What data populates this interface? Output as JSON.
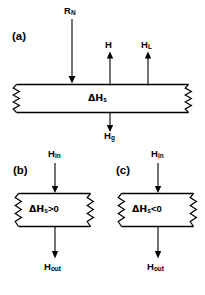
{
  "figure": {
    "type": "energy-balance-box-diagram",
    "background_color": "#ffffff",
    "line_color": "#000000",
    "panels": [
      {
        "id": "a",
        "tag": "(a)",
        "box_label": "ΔH",
        "box_label_sub": "s",
        "fluxes": [
          {
            "name": "R_N",
            "label": "R",
            "sub": "N",
            "direction": "down",
            "side": "top"
          },
          {
            "name": "H",
            "label": "H",
            "sub": "",
            "direction": "up",
            "side": "top"
          },
          {
            "name": "H_L",
            "label": "H",
            "sub": "L",
            "direction": "up",
            "side": "top"
          },
          {
            "name": "H_g",
            "label": "H",
            "sub": "g",
            "direction": "down",
            "side": "bottom"
          }
        ]
      },
      {
        "id": "b",
        "tag": "(b)",
        "box_label": "ΔH",
        "box_label_sub": "s",
        "box_label_rest": ">0",
        "fluxes": [
          {
            "name": "H_in",
            "label": "H",
            "sub": "in",
            "direction": "down",
            "side": "top"
          },
          {
            "name": "H_out",
            "label": "H",
            "sub": "out",
            "direction": "down",
            "side": "bottom"
          }
        ]
      },
      {
        "id": "c",
        "tag": "(c)",
        "box_label": "ΔH",
        "box_label_sub": "s",
        "box_label_rest": "<0",
        "fluxes": [
          {
            "name": "H_in",
            "label": "H",
            "sub": "in",
            "direction": "down",
            "side": "top"
          },
          {
            "name": "H_out",
            "label": "H",
            "sub": "out",
            "direction": "down",
            "side": "bottom"
          }
        ]
      }
    ]
  },
  "labels": {
    "panel_a_tag": "(a)",
    "panel_b_tag": "(b)",
    "panel_c_tag": "(c)",
    "rn_main": "R",
    "rn_sub": "N",
    "h_main": "H",
    "hl_main": "H",
    "hl_sub": "L",
    "hg_main": "H",
    "hg_sub": "g",
    "dhs_delta": "ΔH",
    "dhs_sub": "s",
    "hin_main": "H",
    "hin_sub": "in",
    "hout_main": "H",
    "hout_sub": "out",
    "dhs_gt_delta": "ΔH",
    "dhs_gt_sub": "s",
    "dhs_gt_rest": ">0",
    "dhs_lt_delta": "ΔH",
    "dhs_lt_sub": "s",
    "dhs_lt_rest": "<0"
  }
}
